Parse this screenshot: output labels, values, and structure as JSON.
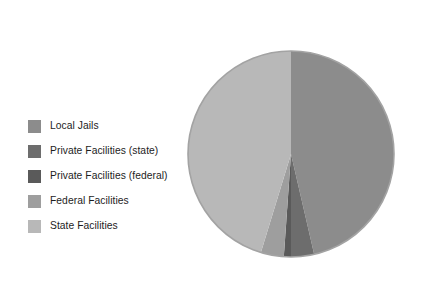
{
  "chart_data": {
    "type": "pie",
    "title": "",
    "subtitle": "",
    "xlabel": "",
    "ylabel": "",
    "grid": false,
    "legend_position": "left",
    "start_angle_deg": 0,
    "direction": "clockwise",
    "categories": [
      "Local Jails",
      "Private Facilities (state)",
      "Private Facilities (federal)",
      "Federal Facilities",
      "State Facilities"
    ],
    "values": [
      46.4,
      3.6,
      1.1,
      3.6,
      45.3
    ],
    "colors": [
      "#8c8c8c",
      "#6d6d6d",
      "#5a5a5a",
      "#9e9e9e",
      "#b8b8b8"
    ],
    "slices": [
      {
        "label": "Local Jails",
        "value": 46.4,
        "color": "#8c8c8c",
        "start_deg": 0,
        "end_deg": 167.0
      },
      {
        "label": "Private Facilities (state)",
        "value": 3.6,
        "color": "#6d6d6d",
        "start_deg": 167.0,
        "end_deg": 180.0
      },
      {
        "label": "Private Facilities (federal)",
        "value": 1.1,
        "color": "#5a5a5a",
        "start_deg": 180.0,
        "end_deg": 184.0
      },
      {
        "label": "Federal Facilities",
        "value": 3.6,
        "color": "#9e9e9e",
        "start_deg": 184.0,
        "end_deg": 197.0
      },
      {
        "label": "State Facilities",
        "value": 45.3,
        "color": "#b8b8b8",
        "start_deg": 197.0,
        "end_deg": 360.0
      }
    ],
    "edge_color": "#a3a3a3",
    "background": "#ffffff"
  },
  "legend": {
    "items": [
      {
        "label": "Local Jails",
        "color": "#8c8c8c"
      },
      {
        "label": "Private Facilities (state)",
        "color": "#6d6d6d"
      },
      {
        "label": "Private Facilities (federal)",
        "color": "#5a5a5a"
      },
      {
        "label": "Federal Facilities",
        "color": "#9e9e9e"
      },
      {
        "label": "State Facilities",
        "color": "#b8b8b8"
      }
    ]
  }
}
